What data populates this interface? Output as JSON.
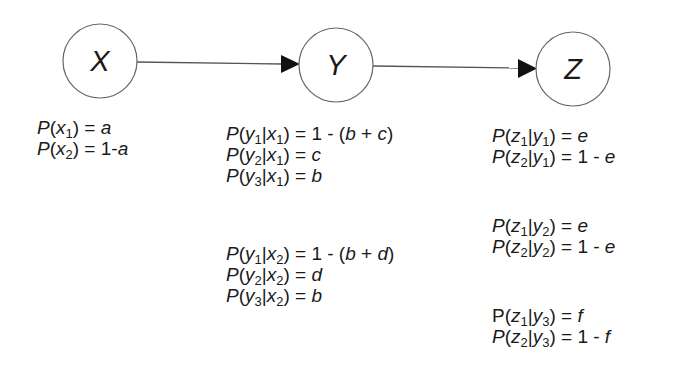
{
  "diagram": {
    "type": "bayesian-network-chain",
    "nodes": [
      {
        "id": "X",
        "label": "X"
      },
      {
        "id": "Y",
        "label": "Y"
      },
      {
        "id": "Z",
        "label": "Z"
      }
    ],
    "edges": [
      {
        "from": "X",
        "to": "Y"
      },
      {
        "from": "Y",
        "to": "Z"
      }
    ],
    "colors": {
      "stroke": "#555555",
      "text": "#1a1a1a",
      "arrowhead": "#111111",
      "background": "#ffffff"
    }
  },
  "tables": {
    "x": {
      "rows": [
        {
          "var": "x",
          "sub": "1",
          "eq": " = ",
          "val": "a"
        },
        {
          "var": "x",
          "sub": "2",
          "eq": " = 1-",
          "val": "a"
        }
      ]
    },
    "y": {
      "groups": [
        {
          "rows": [
            {
              "var": "y",
              "sub": "1",
              "given": "x",
              "gsub": "1",
              "eq": " = 1 - (",
              "val": "b",
              "plus": " + ",
              "val2": "c",
              "close": ")"
            },
            {
              "var": "y",
              "sub": "2",
              "given": "x",
              "gsub": "1",
              "eq": " = ",
              "val": "c"
            },
            {
              "var": "y",
              "sub": "3",
              "given": "x",
              "gsub": "1",
              "eq": " = ",
              "val": "b"
            }
          ]
        },
        {
          "rows": [
            {
              "var": "y",
              "sub": "1",
              "given": "x",
              "gsub": "2",
              "eq": " = 1 - (",
              "val": "b",
              "plus": " + ",
              "val2": "d",
              "close": ")"
            },
            {
              "var": "y",
              "sub": "2",
              "given": "x",
              "gsub": "2",
              "eq": " = ",
              "val": "d"
            },
            {
              "var": "y",
              "sub": "3",
              "given": "x",
              "gsub": "2",
              "eq": " = ",
              "val": "b"
            }
          ]
        }
      ]
    },
    "z": {
      "groups": [
        {
          "rows": [
            {
              "var": "z",
              "sub": "1",
              "given": "y",
              "gsub": "1",
              "eq": " = ",
              "val": "e"
            },
            {
              "var": "z",
              "sub": "2",
              "given": "y",
              "gsub": "1",
              "eq": " = 1 - ",
              "val": "e"
            }
          ]
        },
        {
          "rows": [
            {
              "var": "z",
              "sub": "1",
              "given": "y",
              "gsub": "2",
              "eq": " = ",
              "val": "e"
            },
            {
              "var": "z",
              "sub": "2",
              "given": "y",
              "gsub": "2",
              "eq": " = 1 - ",
              "val": "e"
            }
          ]
        },
        {
          "rows": [
            {
              "var": "z",
              "sub": "1",
              "given": "y",
              "gsub": "3",
              "eq": " = ",
              "val": "f"
            },
            {
              "var": "z",
              "sub": "2",
              "given": "y",
              "gsub": "3",
              "eq": " = 1 - ",
              "val": "f"
            }
          ]
        }
      ]
    },
    "p_symbol": "P",
    "open_paren": "(",
    "bar": "|",
    "close_paren": ")"
  }
}
